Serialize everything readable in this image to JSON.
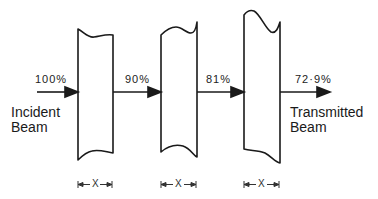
{
  "diagram": {
    "input_label": "Incident\nBeam",
    "output_label": "Transmitted\nBeam",
    "intensities": [
      "100%",
      "90%",
      "81%",
      "72·9%"
    ],
    "thickness_label": "X",
    "slabs": 3,
    "colors": {
      "stroke": "#1a1a1a",
      "background": "#ffffff"
    }
  }
}
